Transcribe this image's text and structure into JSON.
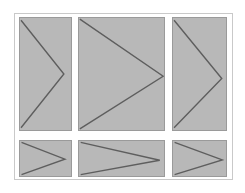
{
  "figure": {
    "title": "",
    "background_color": "#ffffff",
    "frame": {
      "border_color": "#c9c9c9",
      "fill_color": "#ffffff"
    },
    "panel_style": {
      "fill_color": "#b8b8b8",
      "border_color": "#9a9a9a",
      "line_color": "#5e5e5e"
    },
    "layout": {
      "rows": 2,
      "columns": 3,
      "row_labels": [
        "top",
        "bottom"
      ],
      "column_labels": [
        "left",
        "center",
        "right"
      ]
    },
    "panels": [
      {
        "id": "panel-top-left",
        "row": "top",
        "column": "left",
        "shape": "chevron-right",
        "apex_x_pct": 86,
        "apex_y_pct": 50
      },
      {
        "id": "panel-top-center",
        "row": "top",
        "column": "center",
        "shape": "chevron-right",
        "apex_x_pct": 99,
        "apex_y_pct": 52
      },
      {
        "id": "panel-top-right",
        "row": "top",
        "column": "right",
        "shape": "chevron-right",
        "apex_x_pct": 92,
        "apex_y_pct": 54
      },
      {
        "id": "panel-bottom-left",
        "row": "bottom",
        "column": "left",
        "shape": "chevron-right",
        "apex_x_pct": 88,
        "apex_y_pct": 52
      },
      {
        "id": "panel-bottom-center",
        "row": "bottom",
        "column": "center",
        "shape": "chevron-right",
        "apex_x_pct": 95,
        "apex_y_pct": 55
      },
      {
        "id": "panel-bottom-right",
        "row": "bottom",
        "column": "right",
        "shape": "chevron-right",
        "apex_x_pct": 93,
        "apex_y_pct": 54
      }
    ]
  },
  "chart_data": {
    "type": "line",
    "title": "",
    "subtitle": "",
    "xlabel": "",
    "ylabel": "",
    "grid": false,
    "legend": null,
    "xlim": [
      0,
      100
    ],
    "ylim": [
      0,
      100
    ],
    "series": [
      {
        "name": "panel-top-left",
        "x": [
          2,
          86,
          2
        ],
        "y": [
          2,
          50,
          98
        ]
      },
      {
        "name": "panel-top-center",
        "x": [
          1,
          99,
          1
        ],
        "y": [
          1,
          52,
          99
        ]
      },
      {
        "name": "panel-top-right",
        "x": [
          2,
          92,
          2
        ],
        "y": [
          2,
          54,
          98
        ]
      },
      {
        "name": "panel-bottom-left",
        "x": [
          3,
          88,
          3
        ],
        "y": [
          4,
          52,
          96
        ]
      },
      {
        "name": "panel-bottom-center",
        "x": [
          2,
          95,
          2
        ],
        "y": [
          4,
          55,
          96
        ]
      },
      {
        "name": "panel-bottom-right",
        "x": [
          3,
          93,
          3
        ],
        "y": [
          4,
          54,
          96
        ]
      }
    ]
  }
}
